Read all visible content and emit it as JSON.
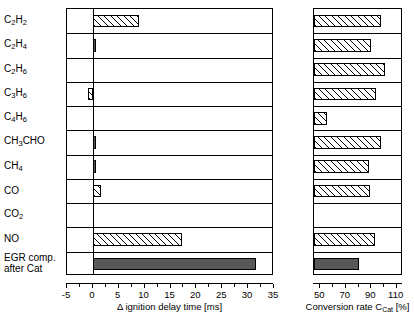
{
  "chart_data": {
    "type": "bar",
    "title": "",
    "orientation": "horizontal",
    "categories": [
      "C2H2",
      "C2H4",
      "C2H6",
      "C3H6",
      "C4H6",
      "CH3CHO",
      "CH4",
      "CO",
      "CO2",
      "NO",
      "EGR comp. after Cat"
    ],
    "category_labels_html": [
      "C<sub>2</sub>H<sub>2</sub>",
      "C<sub>2</sub>H<sub>4</sub>",
      "C<sub>2</sub>H<sub>6</sub>",
      "C<sub>3</sub>H<sub>6</sub>",
      "C<sub>4</sub>H<sub>6</sub>",
      "CH<sub>3</sub>CHO",
      "CH<sub>4</sub>",
      "CO",
      "CO<sub>2</sub>",
      "NO",
      "EGR comp.\nafter Cat"
    ],
    "panels": [
      {
        "name": "ignition-delay",
        "xlabel": "Δ ignition delay time [ms]",
        "xlabel_parts": {
          "pre": "Δ ignition delay time [ms]"
        },
        "xlim": [
          -5,
          35
        ],
        "xticks": [
          -5,
          0,
          5,
          10,
          15,
          20,
          25,
          30,
          35
        ],
        "xticklabels": [
          "-5",
          "0",
          "5",
          "10",
          "15",
          "20",
          "25",
          "30",
          "35"
        ],
        "minor_ticks": [
          -2.5,
          2.5,
          7.5,
          12.5,
          17.5,
          22.5,
          27.5,
          32.5
        ],
        "zero_reference": 0,
        "values": [
          9.0,
          0.5,
          0.0,
          -1.0,
          0.0,
          0.2,
          0.4,
          1.6,
          0.0,
          17.3,
          31.5
        ],
        "styles": [
          "hatch",
          "solid",
          "none",
          "hatch",
          "none",
          "solid",
          "solid",
          "hatch",
          "none",
          "hatch",
          "solid"
        ]
      },
      {
        "name": "conversion-rate",
        "xlabel": "Conversion rate C_Cat [%]",
        "xlabel_parts": {
          "pre": "Conversion rate C",
          "sub": "Cat",
          "post": " [%]"
        },
        "xlim": [
          45,
          115
        ],
        "xticks": [
          50,
          70,
          90,
          110
        ],
        "xticklabels": [
          "50",
          "70",
          "90",
          "110"
        ],
        "minor_ticks": [
          60,
          80,
          100
        ],
        "baseline": 45,
        "values": [
          98.0,
          90.0,
          101.0,
          94.0,
          55.0,
          98.0,
          88.0,
          89.0,
          null,
          93.0,
          80.0
        ],
        "styles": [
          "hatch",
          "hatch",
          "hatch",
          "hatch",
          "hatch",
          "hatch",
          "hatch",
          "hatch",
          "none",
          "hatch",
          "solid"
        ]
      }
    ],
    "legend": [],
    "grid": false,
    "colors": {
      "hatch_line": "#000000",
      "solid_fill": "#585858",
      "frame": "#000000"
    }
  }
}
